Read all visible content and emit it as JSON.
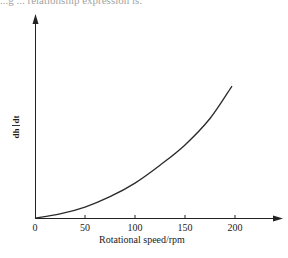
{
  "header": {
    "cropped_text": "...g ... relationship expression is:"
  },
  "chart_data": {
    "type": "line",
    "title": "",
    "xlabel": "Rotational speed/rpm",
    "ylabel": "dh/dt",
    "ylabel_parts": {
      "numerator": "dh",
      "denominator": "dt"
    },
    "x_ticks": [
      0,
      50,
      100,
      150,
      200
    ],
    "x_tick_labels": [
      "0",
      "50",
      "100",
      "150",
      "200"
    ],
    "xlim": [
      0,
      240
    ],
    "ylim": [
      0,
      1
    ],
    "y_ticks": [],
    "grid": false,
    "legend": null,
    "series": [
      {
        "name": "dh/dt vs rotational speed",
        "x": [
          0,
          25,
          50,
          75,
          100,
          125,
          150,
          175,
          197
        ],
        "y": [
          0,
          0.02,
          0.054,
          0.105,
          0.172,
          0.26,
          0.36,
          0.49,
          0.65
        ]
      }
    ],
    "colors": {
      "line": "#222222",
      "axis": "#222222"
    }
  }
}
